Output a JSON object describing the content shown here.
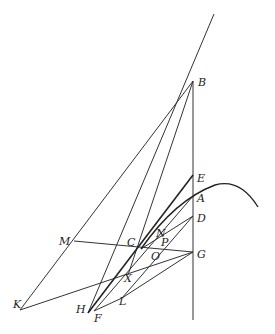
{
  "diagram": {
    "type": "geometric-construction",
    "colors": {
      "line": "#333333",
      "background": "#ffffff"
    },
    "points": {
      "B": {
        "label": "B",
        "x": 193,
        "y": 81,
        "lx": 198,
        "ly": 86
      },
      "E": {
        "label": "E",
        "x": 193,
        "y": 175,
        "lx": 197,
        "ly": 182
      },
      "A": {
        "label": "A",
        "x": 193,
        "y": 196,
        "lx": 197,
        "ly": 202
      },
      "D": {
        "label": "D",
        "x": 193,
        "y": 216,
        "lx": 197,
        "ly": 222
      },
      "G": {
        "label": "G",
        "x": 193,
        "y": 252,
        "lx": 197,
        "ly": 258
      },
      "C": {
        "label": "C",
        "x": 141,
        "y": 249,
        "lx": 127,
        "ly": 246
      },
      "N": {
        "label": "N",
        "x": 157,
        "y": 230,
        "lx": 156,
        "ly": 237
      },
      "P": {
        "label": "P",
        "x": 158,
        "y": 240,
        "lx": 161,
        "ly": 246
      },
      "O": {
        "label": "O",
        "x": 153,
        "y": 251,
        "lx": 151,
        "ly": 260
      },
      "M": {
        "label": "M",
        "x": 74,
        "y": 241,
        "lx": 59,
        "ly": 245
      },
      "X": {
        "label": "X",
        "x": 128,
        "y": 275,
        "lx": 124,
        "ly": 282
      },
      "L": {
        "label": "L",
        "x": 122,
        "y": 298,
        "lx": 119,
        "ly": 305
      },
      "K": {
        "label": "K",
        "x": 20,
        "y": 310,
        "lx": 13,
        "ly": 308
      },
      "H": {
        "label": "H",
        "x": 88,
        "y": 313,
        "lx": 76,
        "ly": 313
      },
      "F": {
        "label": "F",
        "x": 94,
        "y": 311,
        "lx": 94,
        "ly": 322
      }
    }
  }
}
